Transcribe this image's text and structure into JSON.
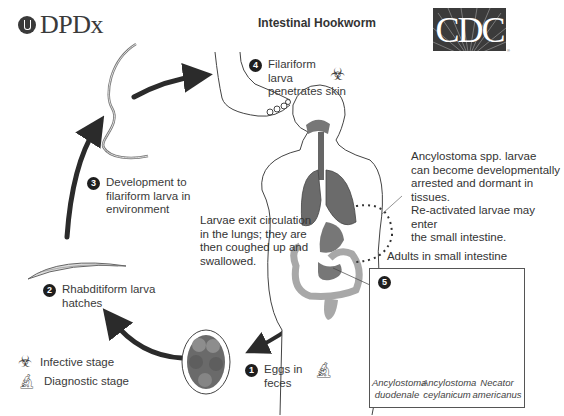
{
  "header": {
    "logo_left": "DPDx",
    "title": "Intestinal Hookworm",
    "logo_right": "CDC"
  },
  "steps": [
    {
      "number": "1",
      "label_line1": "Eggs in",
      "label_line2": "feces",
      "stage_icon": "microscope-icon"
    },
    {
      "number": "2",
      "label_line1": "Rhabditiform larva",
      "label_line2": "hatches"
    },
    {
      "number": "3",
      "label_line1": "Development to",
      "label_line2": "filariform larva in",
      "label_line3": "environment"
    },
    {
      "number": "4",
      "label_line1": "Filariform",
      "label_line2": "larva",
      "label_line3": "penetrates skin",
      "stage_icon": "biohazard-icon"
    },
    {
      "number": "5",
      "box_title": "Adults in small intestine"
    }
  ],
  "notes": {
    "lungs": [
      "Larvae exit circulation",
      "in the lungs; they are",
      "then coughed up and",
      "swallowed."
    ],
    "arrested": [
      "Ancylostoma spp. larvae",
      "can become developmentally",
      "arrested and dormant in tissues.",
      "Re-activated larvae may enter",
      "the small intestine."
    ]
  },
  "species": [
    {
      "genus": "Ancylostoma",
      "species": "duodenale"
    },
    {
      "genus": "Ancylostoma",
      "species": "ceylanicum"
    },
    {
      "genus": "Necator",
      "species": "americanus"
    }
  ],
  "legend": {
    "infective": "Infective stage",
    "diagnostic": "Diagnostic stage"
  },
  "colors": {
    "arrow": "#2b2b2b",
    "organ_dark": "#6b6b6b",
    "organ_light": "#a8a8a8",
    "outline": "#444444"
  }
}
